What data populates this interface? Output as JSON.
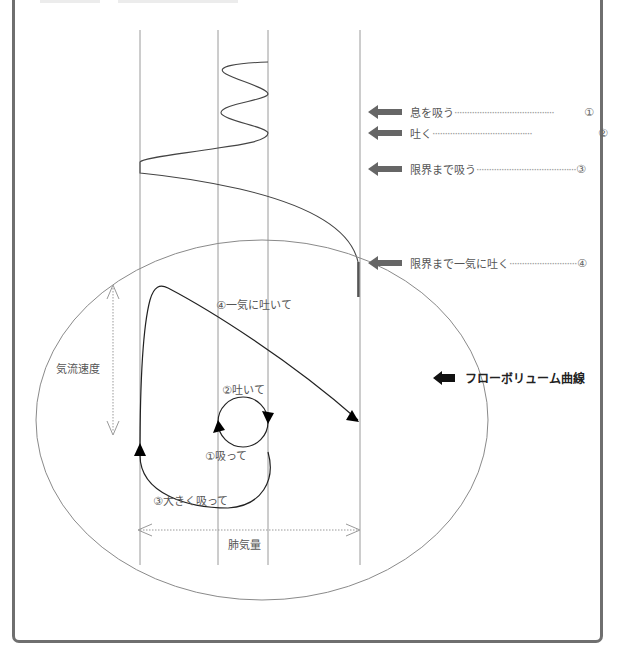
{
  "frame": {
    "border_color": "#6f6f6f"
  },
  "legend": {
    "items": [
      {
        "label": "息を吸う",
        "number": "①"
      },
      {
        "label": "吐く",
        "number": "②"
      },
      {
        "label": "限界まで吸う",
        "number": "③"
      },
      {
        "label": "限界まで一気に吐く",
        "number": "④"
      }
    ],
    "arrow_color": "#666666",
    "leader": "········································"
  },
  "flow_volume": {
    "label": "フローボリューム曲線",
    "arrow_color": "#111111"
  },
  "axes": {
    "y_label": "気流速度",
    "x_label": "肺気量"
  },
  "annotations": {
    "step1": "①吸って",
    "step2": "②吐いて",
    "step3": "③大きく吸って",
    "step4": "④一気に吐いて"
  }
}
